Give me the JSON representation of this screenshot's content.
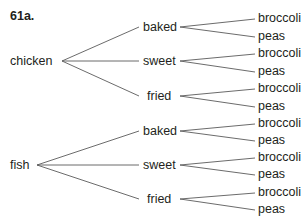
{
  "title": "61a.",
  "tree": {
    "roots": [
      {
        "label": "chicken",
        "pos": {
          "x": 10,
          "y": 61
        },
        "anchor": {
          "x": 62,
          "y": 61
        },
        "children": [
          {
            "label": "baked",
            "pos": {
              "x": 143,
              "y": 27
            },
            "in": {
              "x": 139,
              "y": 27
            },
            "out": {
              "x": 180,
              "y": 27
            },
            "leaves": [
              {
                "label": "broccoli",
                "y": 18
              },
              {
                "label": "peas",
                "y": 36
              }
            ]
          },
          {
            "label": "sweet",
            "pos": {
              "x": 143,
              "y": 61
            },
            "in": {
              "x": 139,
              "y": 61
            },
            "out": {
              "x": 180,
              "y": 61
            },
            "leaves": [
              {
                "label": "broccoli",
                "y": 53
              },
              {
                "label": "peas",
                "y": 71
              }
            ]
          },
          {
            "label": "fried",
            "pos": {
              "x": 147,
              "y": 96
            },
            "in": {
              "x": 139,
              "y": 96
            },
            "out": {
              "x": 180,
              "y": 96
            },
            "leaves": [
              {
                "label": "broccoli",
                "y": 88
              },
              {
                "label": "peas",
                "y": 106
              }
            ]
          }
        ]
      },
      {
        "label": "fish",
        "pos": {
          "x": 10,
          "y": 165
        },
        "anchor": {
          "x": 37,
          "y": 165
        },
        "children": [
          {
            "label": "baked",
            "pos": {
              "x": 143,
              "y": 131
            },
            "in": {
              "x": 139,
              "y": 131
            },
            "out": {
              "x": 180,
              "y": 131
            },
            "leaves": [
              {
                "label": "broccoli",
                "y": 123
              },
              {
                "label": "peas",
                "y": 140
              }
            ]
          },
          {
            "label": "sweet",
            "pos": {
              "x": 143,
              "y": 165
            },
            "in": {
              "x": 139,
              "y": 165
            },
            "out": {
              "x": 180,
              "y": 165
            },
            "leaves": [
              {
                "label": "broccoli",
                "y": 157
              },
              {
                "label": "peas",
                "y": 174
              }
            ]
          },
          {
            "label": "fried",
            "pos": {
              "x": 147,
              "y": 199
            },
            "in": {
              "x": 139,
              "y": 199
            },
            "out": {
              "x": 180,
              "y": 199
            },
            "leaves": [
              {
                "label": "broccoli",
                "y": 192
              },
              {
                "label": "peas",
                "y": 209
              }
            ]
          }
        ]
      }
    ],
    "leaf_x": 258,
    "leaf_line_end_x": 255
  }
}
